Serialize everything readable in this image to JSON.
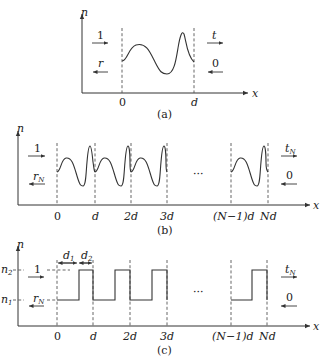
{
  "figure": {
    "panels": [
      {
        "id": "a",
        "caption": "(a)",
        "y_axis_label": "n",
        "x_axis_label": "x",
        "x_ticks": [
          "0",
          "d"
        ],
        "incident_label": "1",
        "reflected_label": "r",
        "transmitted_label": "t",
        "incoming_right_label": "0"
      },
      {
        "id": "b",
        "caption": "(b)",
        "y_axis_label": "n",
        "x_axis_label": "x",
        "x_ticks": [
          "0",
          "d",
          "2d",
          "3d",
          "(N−1)d",
          "Nd"
        ],
        "incident_label": "1",
        "reflected_label": "r",
        "reflected_sub": "N",
        "transmitted_label": "t",
        "transmitted_sub": "N",
        "incoming_right_label": "0",
        "ellipsis": "···"
      },
      {
        "id": "c",
        "caption": "(c)",
        "y_axis_label": "n",
        "x_axis_label": "x",
        "level_high_label": "n",
        "level_high_sub": "2",
        "level_low_label": "n",
        "level_low_sub": "1",
        "layer1_label": "d",
        "layer1_sub": "1",
        "layer2_label": "d",
        "layer2_sub": "2",
        "x_ticks": [
          "0",
          "d",
          "2d",
          "3d",
          "(N−1)d",
          "Nd"
        ],
        "incident_label": "1",
        "reflected_label": "r",
        "reflected_sub": "N",
        "transmitted_label": "t",
        "transmitted_sub": "N",
        "incoming_right_label": "0",
        "ellipsis": "···"
      }
    ]
  }
}
